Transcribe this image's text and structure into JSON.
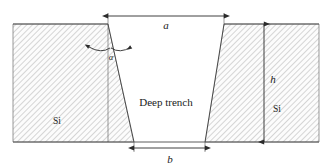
{
  "figure": {
    "background_color": "#ffffff",
    "line_color": "#3a3a3a",
    "hatch_color": "#b9b9b9",
    "hatch_fill": "#fbfbfb",
    "text_color": "#1a1a1a"
  },
  "labels": {
    "top_width": "a",
    "bottom_width": "b",
    "height": "h",
    "angle": "α",
    "trench": "Deep trench",
    "material_left": "Si",
    "material_right": "Si"
  },
  "geometry": {
    "surface_y": 24,
    "bottom_y": 142,
    "substrate_left_x": 13,
    "substrate_right_x": 319,
    "trench_top_left_x": 108,
    "trench_top_right_x": 224,
    "trench_bottom_left_x": 134,
    "trench_bottom_right_x": 205,
    "reference_line_x": 108,
    "height_dim_x": 264,
    "top_dim_y": 16,
    "bottom_dim_y": 148,
    "hatch_spacing": 4,
    "hatch_angle_deg": 45
  },
  "annotations": {
    "top_dimension": {
      "label": "a",
      "from_x": 108,
      "to_x": 224,
      "y": 16
    },
    "bottom_dimension": {
      "label": "b",
      "from_x": 134,
      "to_x": 205,
      "y": 148
    },
    "height_dimension": {
      "label": "h",
      "x": 264,
      "from_y": 24,
      "to_y": 142
    },
    "angle_annotation": {
      "label": "α",
      "vertex_x": 108,
      "vertex_y": 24
    }
  }
}
